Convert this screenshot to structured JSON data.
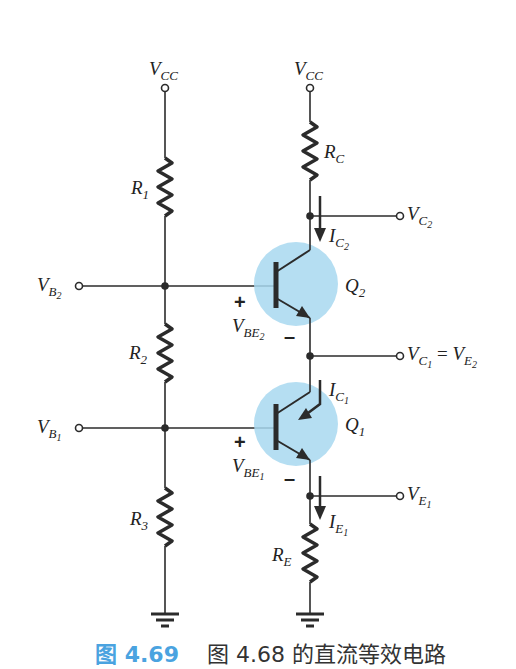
{
  "diagram": {
    "type": "circuit-schematic",
    "supplies": [
      {
        "id": "vcc_left",
        "label_main": "V",
        "label_sub": "CC"
      },
      {
        "id": "vcc_right",
        "label_main": "V",
        "label_sub": "CC"
      }
    ],
    "resistors": [
      {
        "id": "R1",
        "label_main": "R",
        "label_sub": "1"
      },
      {
        "id": "R2",
        "label_main": "R",
        "label_sub": "2"
      },
      {
        "id": "R3",
        "label_main": "R",
        "label_sub": "3"
      },
      {
        "id": "RC",
        "label_main": "R",
        "label_sub": "C"
      },
      {
        "id": "RE",
        "label_main": "R",
        "label_sub": "E"
      }
    ],
    "transistors": [
      {
        "id": "Q2",
        "label_main": "Q",
        "label_sub": "2",
        "type": "npn"
      },
      {
        "id": "Q1",
        "label_main": "Q",
        "label_sub": "1",
        "type": "npn"
      }
    ],
    "terminals": {
      "vb2": {
        "main": "V",
        "sub": "B",
        "subsub": "2"
      },
      "vb1": {
        "main": "V",
        "sub": "B",
        "subsub": "1"
      },
      "vc2": {
        "main": "V",
        "sub": "C",
        "subsub": "2"
      },
      "vc1": {
        "main": "V",
        "sub": "C",
        "subsub": "1",
        "eq": "=",
        "main2": "V",
        "sub2": "E",
        "subsub2": "2"
      },
      "ve1": {
        "main": "V",
        "sub": "E",
        "subsub": "1"
      }
    },
    "voltages": {
      "vbe2": {
        "main": "V",
        "sub": "BE",
        "subsub": "2",
        "plus": "+",
        "minus": "–"
      },
      "vbe1": {
        "main": "V",
        "sub": "BE",
        "subsub": "1",
        "plus": "+",
        "minus": "–"
      }
    },
    "currents": {
      "ic2": {
        "main": "I",
        "sub": "C",
        "subsub": "2"
      },
      "ic1": {
        "main": "I",
        "sub": "C",
        "subsub": "1"
      },
      "ie1": {
        "main": "I",
        "sub": "E",
        "subsub": "1"
      }
    },
    "colors": {
      "wire": "#2b2b2b",
      "transistor_highlight": "#a8d8f0",
      "caption_accent": "#4aa3e0"
    }
  },
  "caption": {
    "figure_number": "图 4.69",
    "text": "图 4.68 的直流等效电路"
  }
}
